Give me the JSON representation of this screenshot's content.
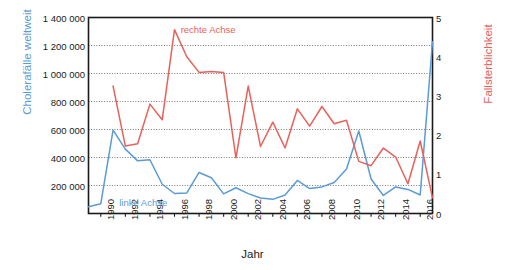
{
  "chart_data": {
    "type": "line",
    "title": "",
    "xlabel": "Jahr",
    "ylabel": "Cholerafälle weltweit",
    "y2label": "Fallsterblichkeit",
    "grid": true,
    "legend_position": "inline-annotations",
    "xlim": [
      1989,
      2017
    ],
    "ylim": [
      0,
      1400000
    ],
    "y2lim": [
      0,
      5
    ],
    "xticks": [
      "1990",
      "1992",
      "1994",
      "1996",
      "1998",
      "2000",
      "2002",
      "2004",
      "2006",
      "2008",
      "2010",
      "2012",
      "2014",
      "2016"
    ],
    "xtick_values": [
      1990,
      1992,
      1994,
      1996,
      1998,
      2000,
      2002,
      2004,
      2006,
      2008,
      2010,
      2012,
      2014,
      2016
    ],
    "yticks": [
      "200 000",
      "400 000",
      "600 000",
      "800 000",
      "1 000 000",
      "1 200 000",
      "1 400 000"
    ],
    "ytick_values": [
      200000,
      400000,
      600000,
      800000,
      1000000,
      1200000,
      1400000
    ],
    "y2ticks": [
      "0",
      "1",
      "2",
      "3",
      "4",
      "5"
    ],
    "y2tick_values": [
      0,
      1,
      2,
      3,
      4,
      5
    ],
    "x": [
      1989,
      1990,
      1991,
      1992,
      1993,
      1994,
      1995,
      1996,
      1997,
      1998,
      1999,
      2000,
      2001,
      2002,
      2003,
      2004,
      2005,
      2006,
      2007,
      2008,
      2009,
      2010,
      2011,
      2012,
      2013,
      2014,
      2015,
      2016,
      2017
    ],
    "series": [
      {
        "name": "linke Achse",
        "axis": "left",
        "color": "#5b9bd5",
        "label": "Cholerafälle weltweit",
        "values": [
          48000,
          70000,
          595000,
          460000,
          376000,
          384000,
          209000,
          143000,
          147000,
          293000,
          255000,
          140000,
          184000,
          142000,
          111000,
          101000,
          132000,
          236000,
          178000,
          190000,
          221000,
          318000,
          589000,
          246000,
          129000,
          190000,
          172000,
          132000,
          1227000
        ]
      },
      {
        "name": "rechte Achse",
        "axis": "right",
        "color": "#e8615a",
        "label": "Fallsterblichkeit",
        "values": [
          null,
          null,
          3.25,
          1.72,
          1.78,
          2.79,
          2.39,
          4.69,
          4.0,
          3.6,
          3.62,
          3.6,
          1.42,
          3.25,
          1.71,
          2.33,
          1.67,
          2.67,
          2.23,
          2.73,
          2.29,
          2.38,
          1.33,
          1.22,
          1.67,
          1.44,
          0.76,
          1.85,
          0.4
        ]
      }
    ],
    "annotations": [
      {
        "text": "rechte Achse",
        "x": 1996.5,
        "y": 4.67,
        "axis": "right",
        "color": "#e8615a"
      },
      {
        "text": "linke Achse",
        "x": 1991.5,
        "y": 75000,
        "axis": "left",
        "color": "#5b9bd5"
      }
    ]
  },
  "axes": {
    "left_title": "Cholerafälle weltweit",
    "right_title": "Fallsterblichkeit",
    "bottom_title": "Jahr"
  },
  "colors": {
    "blue": "#5b9bd5",
    "red": "#e8615a",
    "axis": "#1a1a1a",
    "grid": "#555555",
    "background": "#ffffff"
  }
}
